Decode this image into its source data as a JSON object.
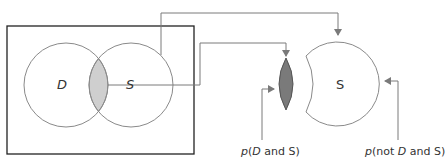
{
  "diagram": {
    "venn": {
      "circle_d_label": "D",
      "circle_s_label": "S"
    },
    "extracted_s": {
      "label": "S"
    },
    "labels": {
      "p_d_and_s": {
        "p": "p",
        "open": "(",
        "d": "D",
        "rest": " and S)"
      },
      "p_not_d_and_s": {
        "p": "p",
        "open": "(not ",
        "d": "D",
        "rest": " and S)"
      }
    },
    "colors": {
      "stroke": "#8a8a8a",
      "frame": "#222222",
      "intersection_fill": "#cfcfcf",
      "lens_fill": "#7a7a7a",
      "arrow": "#7a7a7a"
    }
  }
}
